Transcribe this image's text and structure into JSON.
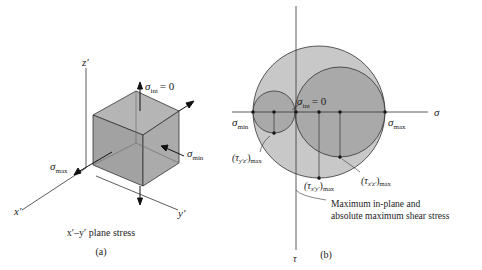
{
  "figure_a": {
    "axes": {
      "x": "x′",
      "y": "y′",
      "z": "z′"
    },
    "stresses": {
      "int": "σ",
      "int_sub": "int",
      "int_val": "= 0",
      "max": "σ",
      "max_sub": "max",
      "min": "σ",
      "min_sub": "min"
    },
    "caption": "x′–y′ plane stress",
    "label": "(a)"
  },
  "figure_b": {
    "axes": {
      "horizontal": "σ",
      "vertical": "τ"
    },
    "points": {
      "sigma_min": {
        "sym": "σ",
        "sub": "min"
      },
      "sigma_max": {
        "sym": "σ",
        "sub": "max"
      },
      "sigma_int": {
        "sym": "σ",
        "sub": "int",
        "val": "= 0"
      }
    },
    "shear_labels": {
      "yz": {
        "sym": "(τ",
        "sub": "y′z′",
        "close": ")",
        "sub2": "max"
      },
      "xz": {
        "sym": "(τ",
        "sub": "x′z′",
        "close": ")",
        "sub2": "max"
      },
      "xy": {
        "sym": "(τ",
        "sub": "x′y′",
        "close": ")",
        "sub2": "max"
      }
    },
    "note_line1": "Maximum in-plane and",
    "note_line2": "absolute maximum shear stress",
    "label": "(b)",
    "colors": {
      "outer_circle": "#c8c8c8",
      "inner_circle": "#a9a9a9",
      "stroke": "#333333"
    }
  }
}
